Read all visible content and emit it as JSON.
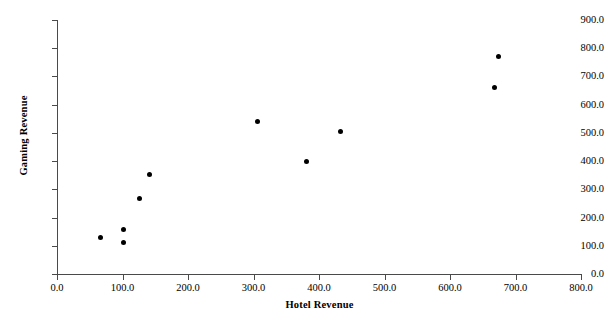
{
  "chart_data": {
    "type": "scatter",
    "title": "",
    "xlabel": "Hotel Revenue",
    "ylabel": "Gaming Revenue",
    "xlim": [
      0,
      800
    ],
    "ylim": [
      0,
      900
    ],
    "xticks": [
      "0.0",
      "100.0",
      "200.0",
      "300.0",
      "400.0",
      "500.0",
      "600.0",
      "700.0",
      "800.0"
    ],
    "yticks": [
      "0.0",
      "100.0",
      "200.0",
      "300.0",
      "400.0",
      "500.0",
      "600.0",
      "700.0",
      "800.0",
      "900.0"
    ],
    "xtick_values": [
      0,
      100,
      200,
      300,
      400,
      500,
      600,
      700,
      800
    ],
    "ytick_values": [
      0,
      100,
      200,
      300,
      400,
      500,
      600,
      700,
      800,
      900
    ],
    "grid": false,
    "legend": null,
    "marker": "filled-circle",
    "marker_color": "#000000",
    "axis_color": "#4a4a4a",
    "background": "#ffffff",
    "x": [
      67,
      101,
      101,
      126,
      141,
      306,
      381,
      433,
      668,
      674
    ],
    "y": [
      130,
      159,
      113,
      268,
      353,
      540,
      400,
      505,
      660,
      770
    ],
    "points": [
      {
        "x": 67,
        "y": 130
      },
      {
        "x": 101,
        "y": 159
      },
      {
        "x": 101,
        "y": 113
      },
      {
        "x": 126,
        "y": 268
      },
      {
        "x": 141,
        "y": 353
      },
      {
        "x": 306,
        "y": 540
      },
      {
        "x": 381,
        "y": 400
      },
      {
        "x": 433,
        "y": 505
      },
      {
        "x": 668,
        "y": 660
      },
      {
        "x": 674,
        "y": 770
      }
    ]
  }
}
